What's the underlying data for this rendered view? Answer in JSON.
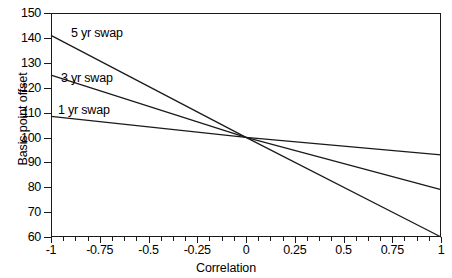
{
  "chart_data": {
    "type": "line",
    "title": "",
    "xlabel": "Correlation",
    "ylabel": "Basis point offset",
    "xlim": [
      -1,
      1
    ],
    "ylim": [
      60,
      150
    ],
    "xticks": [
      -1,
      -0.75,
      -0.5,
      -0.25,
      0,
      0.25,
      0.5,
      0.75,
      1
    ],
    "xticklabels": [
      "-1",
      "-0.75",
      "-0.5",
      "-0.25",
      "0",
      "0.25",
      "0.5",
      "0.75",
      "1"
    ],
    "yticks": [
      60,
      70,
      80,
      90,
      100,
      110,
      120,
      130,
      140,
      150
    ],
    "yticklabels": [
      "60",
      "70",
      "80",
      "90",
      "100",
      "110",
      "120",
      "130",
      "140",
      "150"
    ],
    "grid": false,
    "legend": "in-plot line labels",
    "x": [
      -1,
      0,
      1
    ],
    "series": [
      {
        "name": "5 yr swap",
        "values": [
          141,
          100,
          60
        ],
        "color": "#1a1a1a"
      },
      {
        "name": "3 yr swap",
        "values": [
          125,
          100,
          79
        ],
        "color": "#1a1a1a"
      },
      {
        "name": "1 yr swap",
        "values": [
          108.5,
          100,
          93
        ],
        "color": "#1a1a1a"
      }
    ],
    "annotations": [
      {
        "text": "5 yr swap",
        "x": -0.63,
        "y": 142
      },
      {
        "text": "3 yr swap",
        "x": -0.7,
        "y": 124
      },
      {
        "text": "1 yr swap",
        "x": -0.73,
        "y": 111
      }
    ]
  },
  "axes": {
    "y_title": "Basis point offset",
    "x_title": "Correlation"
  },
  "colors": {
    "axis": "#1a1a1a",
    "line": "#1a1a1a",
    "background": "#ffffff"
  }
}
